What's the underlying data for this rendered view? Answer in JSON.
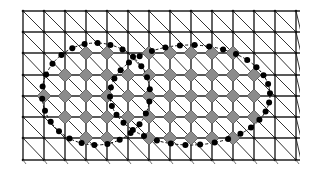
{
  "diagram": {
    "title": "",
    "grid": {
      "x_lines": [
        23,
        44,
        65,
        86,
        107,
        128,
        149,
        170,
        191,
        212,
        233,
        254,
        275,
        296
      ],
      "y_lines": [
        11,
        32,
        53,
        75,
        96,
        117,
        138,
        160
      ],
      "line_color": "#222222",
      "diagonal_color": "#333333"
    },
    "nodes": {
      "fill": "#8c8c8c",
      "stroke": "#555555",
      "size": 7,
      "points": [
        [
          86,
          53
        ],
        [
          107,
          53
        ],
        [
          149,
          53
        ],
        [
          170,
          53
        ],
        [
          191,
          53
        ],
        [
          212,
          53
        ],
        [
          233,
          53
        ],
        [
          65,
          75
        ],
        [
          86,
          75
        ],
        [
          107,
          75
        ],
        [
          128,
          75
        ],
        [
          149,
          75
        ],
        [
          170,
          75
        ],
        [
          191,
          75
        ],
        [
          212,
          75
        ],
        [
          233,
          75
        ],
        [
          254,
          75
        ],
        [
          44,
          96
        ],
        [
          65,
          96
        ],
        [
          86,
          96
        ],
        [
          107,
          96
        ],
        [
          128,
          96
        ],
        [
          149,
          96
        ],
        [
          170,
          96
        ],
        [
          191,
          96
        ],
        [
          212,
          96
        ],
        [
          233,
          96
        ],
        [
          254,
          96
        ],
        [
          65,
          117
        ],
        [
          86,
          117
        ],
        [
          107,
          117
        ],
        [
          128,
          117
        ],
        [
          149,
          117
        ],
        [
          170,
          117
        ],
        [
          191,
          117
        ],
        [
          212,
          117
        ],
        [
          233,
          117
        ],
        [
          254,
          117
        ],
        [
          86,
          138
        ],
        [
          107,
          138
        ],
        [
          149,
          138
        ],
        [
          170,
          138
        ],
        [
          191,
          138
        ],
        [
          212,
          138
        ],
        [
          233,
          138
        ]
      ]
    },
    "contours": [
      {
        "name": "left-ellipse",
        "cx": 96,
        "cy": 94,
        "rx": 54,
        "ry": 51,
        "color": "#111111",
        "dots": 26
      },
      {
        "name": "right-ellipse",
        "cx": 190,
        "cy": 95,
        "rx": 80,
        "ry": 50,
        "color": "#111111",
        "dots": 34
      }
    ],
    "dot_color": "#000000",
    "dot_radius": 3
  }
}
